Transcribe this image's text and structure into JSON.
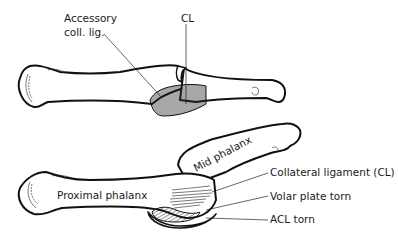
{
  "diagram": {
    "title": "",
    "top_figure": {
      "labels": [
        {
          "id": "accessory",
          "text_line1": "Accessory",
          "text_line2": "coll. lig."
        },
        {
          "id": "cl",
          "text": "CL"
        }
      ]
    },
    "bottom_figure": {
      "bone_labels": [
        {
          "id": "proximal",
          "text": "Proximal phalanx"
        },
        {
          "id": "mid",
          "text": "Mid phalanx"
        }
      ],
      "callouts": [
        {
          "id": "collateral",
          "text": "Collateral ligament (CL)"
        },
        {
          "id": "volar",
          "text": "Volar plate torn"
        },
        {
          "id": "acl",
          "text": "ACL torn"
        }
      ]
    },
    "colors": {
      "line": "#111111",
      "background": "#ffffff"
    }
  }
}
